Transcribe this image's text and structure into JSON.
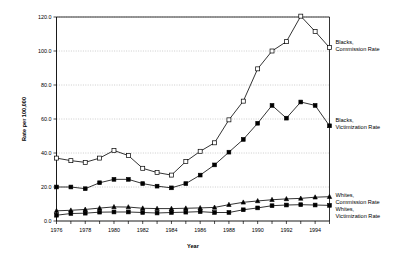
{
  "chart_data": {
    "type": "line",
    "title": "",
    "xlabel": "Year",
    "ylabel": "Rate per 100,000",
    "xlim": [
      1976,
      1995
    ],
    "ylim": [
      0,
      120
    ],
    "grid": true,
    "legend_position": "right-inline",
    "x": [
      1976,
      1977,
      1978,
      1979,
      1980,
      1981,
      1982,
      1983,
      1984,
      1985,
      1986,
      1987,
      1988,
      1989,
      1990,
      1991,
      1992,
      1993,
      1994,
      1995
    ],
    "xticks": [
      1976,
      1978,
      1980,
      1982,
      1984,
      1986,
      1988,
      1990,
      1992,
      1994
    ],
    "xtick_labels": [
      "1976",
      "1978",
      "1980",
      "1982",
      "1984",
      "1986",
      "1988",
      "1990",
      "1992",
      "1994"
    ],
    "yticks": [
      0,
      20,
      40,
      60,
      80,
      100,
      120
    ],
    "ytick_labels": [
      "0.0",
      "20.0",
      "40.0",
      "60.0",
      "80.0",
      "100.0",
      "120.0"
    ],
    "series": [
      {
        "name": "Blacks, Commission Rate",
        "marker": "open-square",
        "label_lines": [
          "Blacks,",
          "Commission Rate"
        ],
        "values": [
          37.0,
          35.5,
          34.5,
          37.0,
          41.5,
          38.5,
          31.0,
          28.5,
          27.0,
          35.0,
          41.0,
          46.0,
          59.5,
          70.5,
          89.5,
          100.0,
          105.5,
          120.5,
          111.5,
          102.0
        ]
      },
      {
        "name": "Blacks, Victimization Rate",
        "marker": "solid-square",
        "label_lines": [
          "Blacks,",
          "Victimization Rate"
        ],
        "values": [
          20.0,
          20.0,
          19.0,
          22.5,
          24.5,
          24.5,
          22.0,
          20.5,
          19.5,
          22.0,
          27.0,
          33.0,
          40.5,
          48.0,
          57.5,
          68.0,
          60.5,
          70.0,
          68.0,
          56.0
        ]
      },
      {
        "name": "Whites, Commission Rate",
        "marker": "solid-triangle",
        "label_lines": [
          "Whites,",
          "Commission Rate"
        ],
        "values": [
          6.0,
          6.3,
          6.8,
          7.6,
          8.3,
          8.2,
          7.5,
          7.3,
          7.3,
          7.5,
          7.7,
          8.0,
          9.6,
          11.0,
          11.8,
          12.5,
          13.0,
          13.3,
          14.0,
          14.3
        ]
      },
      {
        "name": "Whites, Victimization Rate",
        "marker": "solid-square",
        "label_lines": [
          "Whites,",
          "Victimization Rate"
        ],
        "values": [
          3.4,
          4.4,
          4.6,
          5.2,
          5.3,
          5.3,
          5.0,
          4.7,
          5.0,
          5.2,
          5.5,
          5.0,
          5.0,
          6.6,
          7.7,
          9.0,
          9.4,
          9.6,
          9.4,
          9.2
        ]
      }
    ]
  },
  "colors": {
    "line": "#000000",
    "grid": "#9a9a9a",
    "background": "#ffffff"
  }
}
